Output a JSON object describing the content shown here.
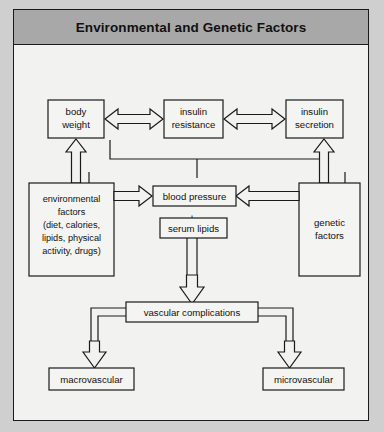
{
  "figure": {
    "title": "Environmental and Genetic Factors",
    "background_color": "#cfcfcf",
    "panel_color": "#f2f2f0",
    "title_band_color": "#a8a8a8",
    "line_color": "#1a1a1a"
  },
  "nodes": {
    "body_weight": {
      "line1": "body",
      "line2": "weight"
    },
    "insulin_resistance": {
      "line1": "insulin",
      "line2": "resistance"
    },
    "insulin_secretion": {
      "line1": "insulin",
      "line2": "secretion"
    },
    "environmental_factors": {
      "line1": "environmental",
      "line2": "factors",
      "line3": "(diet, calories,",
      "line4": "lipids, physical",
      "line5": "activity, drugs)"
    },
    "genetic_factors": {
      "line1": "genetic",
      "line2": "factors"
    },
    "blood_pressure": {
      "label": "blood pressure"
    },
    "plus_sign": {
      "label": "+"
    },
    "serum_lipids": {
      "label": "serum lipids"
    },
    "vascular_complications": {
      "label": "vascular complications"
    },
    "macrovascular": {
      "label": "macrovascular"
    },
    "microvascular": {
      "label": "microvascular"
    }
  },
  "edges": [
    {
      "from": "body_weight",
      "to": "insulin_resistance",
      "style": "double-headed-arrow"
    },
    {
      "from": "insulin_resistance",
      "to": "insulin_secretion",
      "style": "double-headed-arrow"
    },
    {
      "from": "environmental_factors",
      "to": "body_weight",
      "style": "block-arrow-up"
    },
    {
      "from": "genetic_factors",
      "to": "insulin_secretion",
      "style": "block-arrow-up"
    },
    {
      "from": "environmental_factors",
      "to": "blood_pressure",
      "style": "block-arrow-right"
    },
    {
      "from": "genetic_factors",
      "to": "blood_pressure",
      "style": "block-arrow-left"
    },
    {
      "from": "top_row",
      "to": "blood_pressure",
      "style": "bus-connector"
    },
    {
      "from": "serum_lipids",
      "to": "vascular_complications",
      "style": "block-arrow-down"
    },
    {
      "from": "vascular_complications",
      "to": "macrovascular",
      "style": "block-arrow-down"
    },
    {
      "from": "vascular_complications",
      "to": "microvascular",
      "style": "block-arrow-down"
    }
  ]
}
